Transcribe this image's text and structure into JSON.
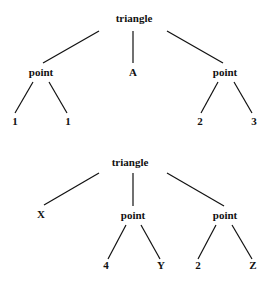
{
  "trees": [
    {
      "root": {
        "label": "triangle",
        "x": 134,
        "y": 22
      },
      "nodes": [
        {
          "label": "point",
          "x": 41,
          "y": 76
        },
        {
          "label": "A",
          "x": 133,
          "y": 76
        },
        {
          "label": "point",
          "x": 225,
          "y": 76
        },
        {
          "label": "1",
          "x": 15,
          "y": 125
        },
        {
          "label": "1",
          "x": 68,
          "y": 125
        },
        {
          "label": "2",
          "x": 200,
          "y": 125
        },
        {
          "label": "3",
          "x": 254,
          "y": 125
        }
      ],
      "edges": [
        [
          99,
          31,
          43,
          63
        ],
        [
          133,
          31,
          133,
          63
        ],
        [
          167,
          31,
          223,
          63
        ],
        [
          33,
          82,
          15,
          113
        ],
        [
          49,
          82,
          67,
          113
        ],
        [
          218,
          82,
          201,
          113
        ],
        [
          234,
          82,
          252,
          113
        ]
      ]
    },
    {
      "root": {
        "label": "triangle",
        "x": 130,
        "y": 166
      },
      "nodes": [
        {
          "label": "X",
          "x": 41,
          "y": 218
        },
        {
          "label": "point",
          "x": 133,
          "y": 219
        },
        {
          "label": "point",
          "x": 225,
          "y": 219
        },
        {
          "label": "4",
          "x": 106,
          "y": 269
        },
        {
          "label": "Y",
          "x": 161,
          "y": 269
        },
        {
          "label": "2",
          "x": 198,
          "y": 269
        },
        {
          "label": "Z",
          "x": 253,
          "y": 269
        }
      ],
      "edges": [
        [
          99,
          173,
          44,
          205
        ],
        [
          133,
          173,
          133,
          206
        ],
        [
          167,
          173,
          224,
          206
        ],
        [
          126,
          225,
          108,
          259
        ],
        [
          141,
          225,
          160,
          259
        ],
        [
          216,
          225,
          198,
          259
        ],
        [
          232,
          225,
          252,
          259
        ]
      ]
    }
  ]
}
